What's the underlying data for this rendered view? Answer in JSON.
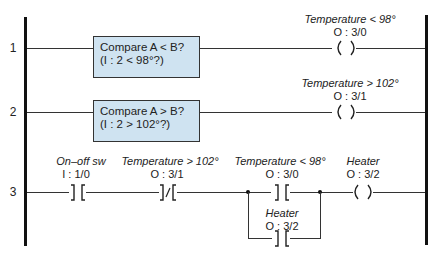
{
  "diagram": {
    "type": "ladder-logic",
    "rails": {
      "left": "power-rail-left",
      "right": "power-rail-right"
    },
    "rungs": [
      {
        "number": "1",
        "instruction": {
          "line1": "Compare A < B?",
          "line2": "(I : 2 < 98°?)"
        },
        "output": {
          "name": "Temperature < 98°",
          "address": "O : 3/0",
          "symbol": "( )"
        }
      },
      {
        "number": "2",
        "instruction": {
          "line1": "Compare A > B?",
          "line2": "(I : 2 > 102°?)"
        },
        "output": {
          "name": "Temperature > 102°",
          "address": "O : 3/1",
          "symbol": "( )"
        }
      },
      {
        "number": "3",
        "contacts": [
          {
            "name": "On–off sw",
            "address": "I : 1/0",
            "type": "normally-open",
            "symbol": "] ["
          },
          {
            "name": "Temperature > 102°",
            "address": "O : 3/1",
            "type": "normally-closed",
            "symbol": "]/["
          },
          {
            "name": "Temperature < 98°",
            "address": "O : 3/0",
            "type": "normally-open",
            "symbol": "] ["
          }
        ],
        "branch": {
          "name": "Heater",
          "address": "O : 3/2",
          "type": "normally-open",
          "symbol": "] ["
        },
        "output": {
          "name": "Heater",
          "address": "O : 3/2",
          "symbol": "( )"
        }
      }
    ],
    "colors": {
      "box_fill": "#cfe3f1",
      "line": "#333333",
      "rail": "#111111"
    }
  }
}
